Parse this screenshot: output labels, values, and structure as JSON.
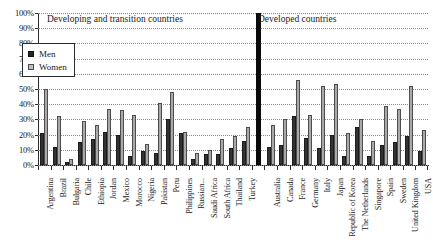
{
  "chart_data": {
    "type": "bar",
    "title": "",
    "xlabel": "",
    "ylabel": "",
    "ylim": [
      0,
      100
    ],
    "ytick_labels": [
      "100%",
      "90%",
      "80%",
      "70%",
      "60%",
      "50%",
      "40%",
      "30%",
      "20%",
      "10%",
      "0%"
    ],
    "ytick_values": [
      100,
      90,
      80,
      70,
      60,
      50,
      40,
      30,
      20,
      10,
      0
    ],
    "grid": true,
    "legend_position": "upper-left-inside",
    "legend": [
      "Men",
      "Women"
    ],
    "series": [
      {
        "name": "Men",
        "color": "#333333",
        "values": [
          21,
          12,
          2,
          15,
          17,
          22,
          20,
          6,
          9,
          8,
          30,
          21,
          4,
          7,
          7,
          11,
          16,
          12,
          13,
          32,
          18,
          11,
          20,
          6,
          25,
          6,
          13,
          15,
          19,
          9
        ]
      },
      {
        "name": "Women",
        "color": "#a9a9a9",
        "values": [
          50,
          32,
          4,
          29,
          26,
          37,
          36,
          33,
          14,
          41,
          48,
          22,
          8,
          10,
          17,
          19,
          25,
          26,
          30,
          56,
          33,
          52,
          53,
          21,
          30,
          16,
          39,
          37,
          52,
          23
        ]
      }
    ],
    "categories": [
      "Argentina",
      "Brazil",
      "Bulgaria",
      "Chile",
      "Ethiopia",
      "Jordan",
      "Mexico",
      "Morocco",
      "Nigeria",
      "Pakistan",
      "Peru",
      "Philippines",
      "Russian...",
      "Saudi Africa",
      "South Africa",
      "Thailand",
      "Turkey",
      "Australia",
      "Canada",
      "France",
      "Germany",
      "Italy",
      "Japan",
      "Republic of Korea",
      "The Netherlands",
      "Singapore",
      "Spain",
      "Sweden",
      "United Kingdom",
      "USA"
    ],
    "groups": [
      {
        "label": "Developing and transition countries",
        "start_index": 0,
        "end_index": 16
      },
      {
        "label": "Developed countries",
        "start_index": 17,
        "end_index": 29
      }
    ],
    "divider": {
      "after_index": 16,
      "label": "group-divider",
      "height_pct": 100,
      "color": "#0a0a0a"
    }
  }
}
